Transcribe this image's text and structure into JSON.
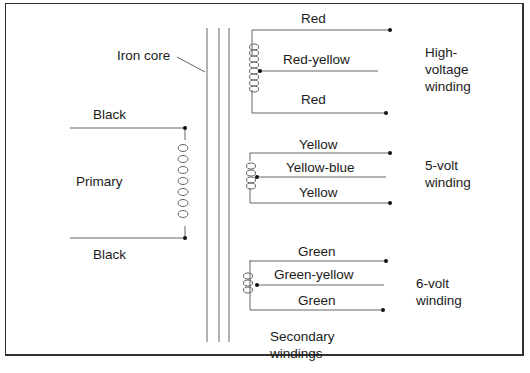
{
  "diagram": {
    "core_label": "Iron core",
    "primary": {
      "label": "Primary",
      "top_lead": "Black",
      "bottom_lead": "Black"
    },
    "secondary_label_line1": "Secondary",
    "secondary_label_line2": "windings",
    "windings": [
      {
        "name_line1": "High-",
        "name_line2": "voltage",
        "name_line3": "winding",
        "top_lead": "Red",
        "center_tap": "Red-yellow",
        "bottom_lead": "Red"
      },
      {
        "name_line1": "5-volt",
        "name_line2": "winding",
        "top_lead": "Yellow",
        "center_tap": "Yellow-blue",
        "bottom_lead": "Yellow"
      },
      {
        "name_line1": "6-volt",
        "name_line2": "winding",
        "top_lead": "Green",
        "center_tap": "Green-yellow",
        "bottom_lead": "Green"
      }
    ]
  }
}
